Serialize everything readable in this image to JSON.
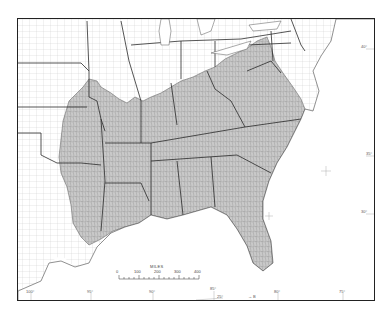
{
  "map": {
    "colors": {
      "shaded_region": "#c9c9c9",
      "county_lines": "#8a8a8a",
      "state_lines": "#2a2a2a",
      "grid": "#b8b8b8",
      "frame": "#222222",
      "background": "#ffffff"
    },
    "scale_bar": {
      "title": "MILES",
      "ticks": [
        "0",
        "100",
        "200",
        "300",
        "400"
      ]
    },
    "longitude_labels": [
      {
        "label": "100°",
        "x": 30
      },
      {
        "label": "95°",
        "x": 90
      },
      {
        "label": "90°",
        "x": 152
      },
      {
        "label": "85°",
        "x": 213
      },
      {
        "label": "80°",
        "x": 277
      },
      {
        "label": "75°",
        "x": 342
      }
    ],
    "latitude_labels": [
      {
        "label": "40°",
        "y": 46
      },
      {
        "label": "35°",
        "y": 153
      },
      {
        "label": "30°",
        "y": 211
      }
    ],
    "other_labels": {
      "lat_25": "25°",
      "inset_arrow": "→ B"
    }
  }
}
